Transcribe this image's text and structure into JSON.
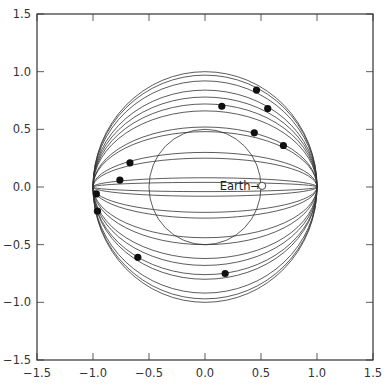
{
  "chart_data": {
    "type": "scatter",
    "title": "",
    "xlabel": "",
    "ylabel": "",
    "xlim": [
      -1.5,
      1.5
    ],
    "ylim": [
      -1.5,
      1.5
    ],
    "grid": false,
    "legend": null,
    "x_ticks": [
      -1.5,
      -1.0,
      -0.5,
      0.0,
      0.5,
      1.0,
      1.5
    ],
    "x_tick_labels": [
      "−1.5",
      "−1.0",
      "−0.5",
      "0.0",
      "0.5",
      "1.0",
      "1.5"
    ],
    "y_ticks": [
      -1.5,
      -1.0,
      -0.5,
      0.0,
      0.5,
      1.0,
      1.5
    ],
    "y_tick_labels": [
      "−1.5",
      "−1.0",
      "−0.5",
      "0.0",
      "0.5",
      "1.0",
      "1.5"
    ],
    "circles": [
      {
        "name": "outer-circle",
        "cx": 0.0,
        "cy": 0.0,
        "r": 1.0
      },
      {
        "name": "inner-circle",
        "cx": 0.0,
        "cy": 0.0,
        "r": 0.5
      }
    ],
    "arcs": {
      "description": "Elliptical arcs passing through (-1,0) and (1,0); value = semi-axis along y (positive = upper, negative = lower)",
      "semi_axes_y": [
        0.97,
        0.92,
        0.84,
        0.78,
        0.72,
        0.66,
        0.52,
        0.48,
        0.3,
        0.25,
        0.08,
        0.04,
        -0.04,
        -0.08,
        -0.22,
        -0.27,
        -0.44,
        -0.5,
        -0.62,
        -0.68,
        -0.76,
        -0.8,
        -0.92,
        -0.97
      ]
    },
    "points": [
      {
        "x": 0.46,
        "y": 0.84
      },
      {
        "x": 0.56,
        "y": 0.68
      },
      {
        "x": 0.15,
        "y": 0.7
      },
      {
        "x": 0.44,
        "y": 0.47
      },
      {
        "x": 0.7,
        "y": 0.36
      },
      {
        "x": -0.67,
        "y": 0.21
      },
      {
        "x": -0.76,
        "y": 0.06
      },
      {
        "x": -0.97,
        "y": -0.06
      },
      {
        "x": -0.96,
        "y": -0.21
      },
      {
        "x": -0.6,
        "y": -0.61
      },
      {
        "x": 0.18,
        "y": -0.75
      }
    ],
    "annotations": [
      {
        "text": "Earth→",
        "x": 0.33,
        "y": 0.01,
        "marker": "open-circle",
        "marker_x": 0.51,
        "marker_y": 0.01
      }
    ]
  },
  "layout": {
    "plot_left": 37,
    "plot_top": 14,
    "plot_right": 373,
    "plot_bottom": 360,
    "line_color": "#333333",
    "point_color": "#111111"
  }
}
